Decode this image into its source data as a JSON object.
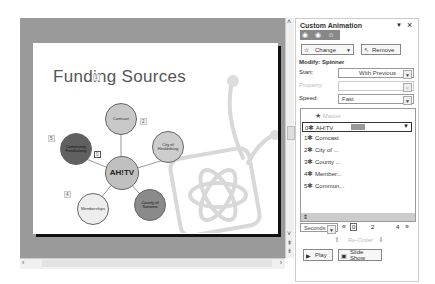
{
  "slide": {
    "title": "Funding Sources",
    "center": "AH!TV",
    "nodes": [
      {
        "num": "1",
        "label": "Comcast",
        "fill": "#c8c8c8"
      },
      {
        "num": "2",
        "label": "City of Healdsburg",
        "fill": "#cdcdcd"
      },
      {
        "num": "3",
        "label": "County of Sonoma",
        "fill": "#8a8a8a"
      },
      {
        "num": "4",
        "label": "Memberships",
        "fill": "#ededed"
      },
      {
        "num": "5",
        "label": "Community Fundraising",
        "fill": "#606060"
      }
    ],
    "center_num": "0"
  },
  "pane": {
    "title": "Custom Animation",
    "menu_icon": "▼",
    "close_icon": "×",
    "change_label": "Change",
    "remove_label": "Remove",
    "modify_label": "Modify: Spinner",
    "start_label": "Start:",
    "start_value": "With Previous",
    "property_label": "Property:",
    "property_value": "",
    "speed_label": "Speed:",
    "speed_value": "Fast",
    "list_header": "Master",
    "list_items": [
      {
        "num": "0",
        "label": "AH!TV"
      },
      {
        "num": "1",
        "label": "Comcast"
      },
      {
        "num": "2",
        "label": "City of ..."
      },
      {
        "num": "3",
        "label": "County ..."
      },
      {
        "num": "4",
        "label": "Member..."
      },
      {
        "num": "5",
        "label": "Commun..."
      }
    ],
    "timeline_unit": "Seconds",
    "timeline_ticks": [
      "0",
      "2",
      "4"
    ],
    "reorder_label": "Re-Order",
    "play_label": "Play",
    "slideshow_label": "Slide Show"
  }
}
